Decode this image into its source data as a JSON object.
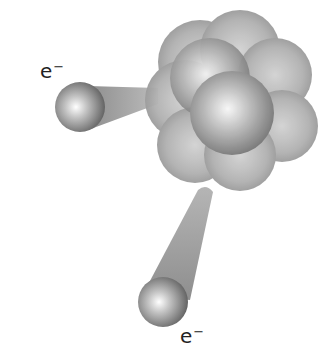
{
  "diagram": {
    "nucleus": {
      "label": "",
      "sphere_color": "#9a9a9a",
      "highlight_color": "#f4f4f4"
    },
    "electrons": [
      {
        "id": "left",
        "symbol": "e",
        "charge": "−"
      },
      {
        "id": "bottom",
        "symbol": "e",
        "charge": "−"
      }
    ],
    "colors": {
      "background": "#ffffff",
      "trail": "#8c8c8c",
      "text": "#222222"
    }
  }
}
